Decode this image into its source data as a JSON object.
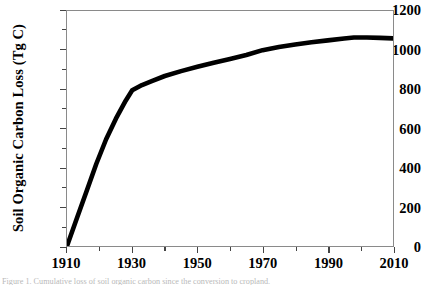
{
  "chart_data": {
    "type": "line",
    "title": "",
    "xlabel": "",
    "ylabel": "Soil Organic Carbon Loss (Tg C)",
    "xlim": [
      1910,
      2010
    ],
    "ylim": [
      0,
      1200
    ],
    "grid": false,
    "legend": null,
    "line_color": "#000000",
    "x_ticks": [
      1910,
      1930,
      1950,
      1970,
      1990,
      2010
    ],
    "x_minor_ticks": [
      1920,
      1940,
      1960,
      1980,
      2000
    ],
    "y_ticks": [
      0,
      200,
      400,
      600,
      800,
      1000,
      1200
    ],
    "x": [
      1910,
      1913,
      1916,
      1919,
      1922,
      1925,
      1928,
      1930,
      1933,
      1936,
      1940,
      1945,
      1950,
      1955,
      1960,
      1965,
      1970,
      1975,
      1980,
      1985,
      1990,
      1995,
      1998,
      2002,
      2006,
      2010
    ],
    "values": [
      0,
      140,
      280,
      420,
      545,
      650,
      742,
      795,
      822,
      842,
      868,
      893,
      915,
      936,
      955,
      975,
      1000,
      1016,
      1029,
      1040,
      1050,
      1060,
      1065,
      1065,
      1063,
      1060
    ],
    "series": [
      {
        "name": "Soil organic carbon loss",
        "values": [
          0,
          140,
          280,
          420,
          545,
          650,
          742,
          795,
          822,
          842,
          868,
          893,
          915,
          936,
          955,
          975,
          1000,
          1016,
          1029,
          1040,
          1050,
          1060,
          1065,
          1065,
          1063,
          1060
        ]
      }
    ],
    "annotations": []
  },
  "axes": {
    "y_title": "Soil Organic Carbon Loss (Tg C)",
    "y_tick_labels": [
      "0",
      "200",
      "400",
      "600",
      "800",
      "1000",
      "1200"
    ],
    "x_tick_labels": [
      "1910",
      "1930",
      "1950",
      "1970",
      "1990",
      "2010"
    ]
  },
  "caption": {
    "text": "Figure 1. Cumulative loss of soil organic carbon since the conversion to cropland."
  },
  "colors": {
    "line": "#000000",
    "axis": "#8a8a8a",
    "tick": "#444444",
    "background": "#ffffff",
    "text": "#000000"
  }
}
